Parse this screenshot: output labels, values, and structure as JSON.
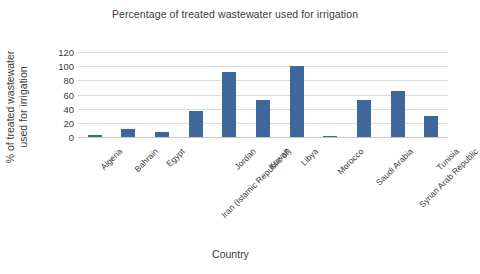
{
  "chart_data": {
    "type": "bar",
    "title": "Percentage of treated wastewater used for irrigation",
    "xlabel": "Country",
    "ylabel": "% of treated wastewater used for irrigation",
    "categories": [
      "Algeria",
      "Bahrain",
      "Egypt",
      "Iran (Islamic Republic of)",
      "Jordan",
      "Kuwait",
      "Libya",
      "Morocco",
      "Saudi Arabia",
      "Syrian Arab Republic",
      "Tunisia"
    ],
    "values": [
      3,
      12,
      7,
      37,
      92,
      52,
      100,
      1,
      52,
      65,
      30
    ],
    "ylim": [
      0,
      120
    ],
    "yticks": [
      0,
      20,
      40,
      60,
      80,
      100,
      120
    ],
    "grid": true,
    "legend": false,
    "series_color": "#40679b",
    "gridline_color": "#dcdcdc"
  }
}
